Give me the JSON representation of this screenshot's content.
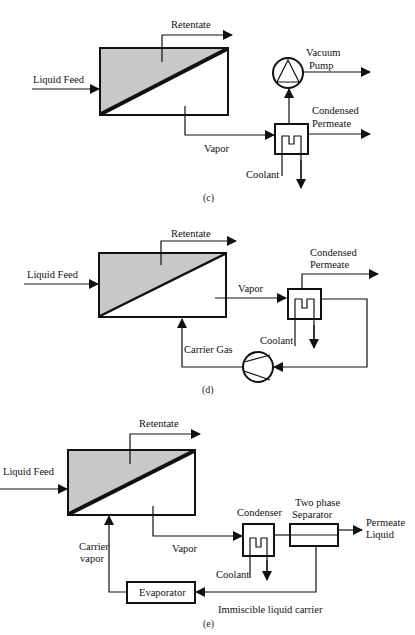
{
  "panels": [
    {
      "id": "c",
      "caption": "(c)",
      "labels": {
        "feed": "Liquid Feed",
        "retentate": "Retentate",
        "vapor": "Vapor",
        "pump_line1": "Vacuum",
        "pump_line2": "Pump",
        "perm_line1": "Condensed",
        "perm_line2": "Permeate",
        "coolant": "Coolant"
      },
      "components": [
        "membrane-module",
        "condenser",
        "vacuum-pump-icon"
      ]
    },
    {
      "id": "d",
      "caption": "(d)",
      "labels": {
        "feed": "Liquid Feed",
        "retentate": "Retentate",
        "vapor": "Vapor",
        "perm_line1": "Condensed",
        "perm_line2": "Permeate",
        "coolant": "Coolant",
        "carrier": "Carrier Gas"
      },
      "components": [
        "membrane-module",
        "condenser",
        "compressor-icon"
      ]
    },
    {
      "id": "e",
      "caption": "(e)",
      "labels": {
        "feed": "Liquid Feed",
        "retentate": "Retentate",
        "vapor": "Vapor",
        "condenser": "Condenser",
        "sep_line1": "Two phase",
        "sep_line2": "Separator",
        "perm_line1": "Permeate",
        "perm_line2": "Liquid",
        "coolant": "Coolant",
        "carrier_line1": "Carrier",
        "carrier_line2": "vapor",
        "evaporator": "Evaporator",
        "immiscible": "Immiscible liquid carrier"
      },
      "components": [
        "membrane-module",
        "condenser",
        "two-phase-separator",
        "evaporator"
      ]
    }
  ],
  "colors": {
    "line": "#111111",
    "membrane_shade": "#c8c8c8",
    "background": "#ffffff"
  }
}
